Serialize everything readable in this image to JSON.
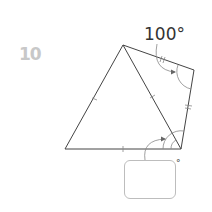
{
  "question": {
    "number": "10",
    "given_angle_label": "100°",
    "answer_unit": "°",
    "answer_value": ""
  },
  "figure": {
    "vertices": [
      "top",
      "top-right",
      "bottom-right",
      "bottom-left"
    ],
    "tick_marks": {
      "single": [
        "left-side",
        "diagonal",
        "bottom-side"
      ],
      "double": [
        "top-right-side",
        "right-side"
      ]
    },
    "colors": {
      "stroke": "#444444",
      "number": "#c8c8c8",
      "box_border": "#bdbdbd"
    }
  }
}
